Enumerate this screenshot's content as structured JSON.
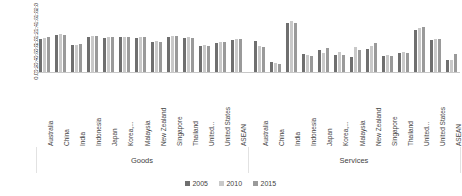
{
  "chart_data": {
    "type": "bar",
    "title": "",
    "subtitle": "",
    "xlabel": "",
    "ylabel": "",
    "ylim": [
      0.0,
      2.0
    ],
    "ytick_labels": [
      "2.0",
      "1.8",
      "1.6",
      "1.4",
      "1.2",
      "1.0",
      "0.8",
      "0.6",
      "0.4",
      "0.2",
      "0.0"
    ],
    "ytick_values": [
      2.0,
      1.8,
      1.6,
      1.4,
      1.2,
      1.0,
      0.8,
      0.6,
      0.4,
      0.2,
      0.0
    ],
    "grid": false,
    "legend_position": "bottom",
    "group_labels": [
      "Goods",
      "Services"
    ],
    "categories": [
      "Australia",
      "China",
      "India",
      "Indonesia",
      "Japan",
      "Korea,...",
      "Malaysia",
      "New Zealand",
      "Singapore",
      "Thailand",
      "United...",
      "United States",
      "ASEAN",
      "Australia",
      "China",
      "India",
      "Indonesia",
      "Japan",
      "Korea,...",
      "Malaysia",
      "New Zealand",
      "Singapore",
      "Thailand",
      "United...",
      "United States",
      "ASEAN"
    ],
    "groups": [
      {
        "name": "Goods",
        "categories": [
          "Australia",
          "China",
          "India",
          "Indonesia",
          "Japan",
          "Korea,...",
          "Malaysia",
          "New Zealand",
          "Singapore",
          "Thailand",
          "United...",
          "United States",
          "ASEAN"
        ]
      },
      {
        "name": "Services",
        "categories": [
          "Australia",
          "China",
          "India",
          "Indonesia",
          "Japan",
          "Korea,...",
          "Malaysia",
          "New Zealand",
          "Singapore",
          "Thailand",
          "United...",
          "United States",
          "ASEAN"
        ]
      }
    ],
    "series": [
      {
        "name": "2005",
        "color": "#6f6f6f",
        "values": [
          1.0,
          1.09,
          0.82,
          1.04,
          1.02,
          1.03,
          1.02,
          0.9,
          1.05,
          1.01,
          0.78,
          0.88,
          0.97,
          0.92,
          0.33,
          1.45,
          0.55,
          0.68,
          0.53,
          0.46,
          0.7,
          0.5,
          0.57,
          1.24,
          0.96,
          0.39
        ]
      },
      {
        "name": "2010",
        "color": "#c9c9c9",
        "values": [
          1.01,
          1.12,
          0.82,
          1.07,
          1.03,
          1.04,
          1.03,
          0.92,
          1.08,
          1.03,
          0.8,
          0.9,
          0.98,
          0.78,
          0.3,
          1.5,
          0.52,
          0.58,
          0.6,
          0.75,
          0.78,
          0.52,
          0.62,
          1.3,
          0.98,
          0.38
        ]
      },
      {
        "name": "2015",
        "color": "#9a9a9a",
        "values": [
          1.03,
          1.11,
          0.83,
          1.06,
          1.04,
          1.04,
          1.04,
          0.91,
          1.06,
          1.02,
          0.79,
          0.91,
          1.0,
          0.76,
          0.27,
          1.46,
          0.48,
          0.72,
          0.52,
          0.68,
          0.86,
          0.5,
          0.58,
          1.33,
          0.99,
          0.56
        ]
      }
    ]
  },
  "legend": {
    "items": [
      {
        "label": "2005",
        "color": "#6f6f6f"
      },
      {
        "label": "2010",
        "color": "#c9c9c9"
      },
      {
        "label": "2015",
        "color": "#9a9a9a"
      }
    ]
  }
}
